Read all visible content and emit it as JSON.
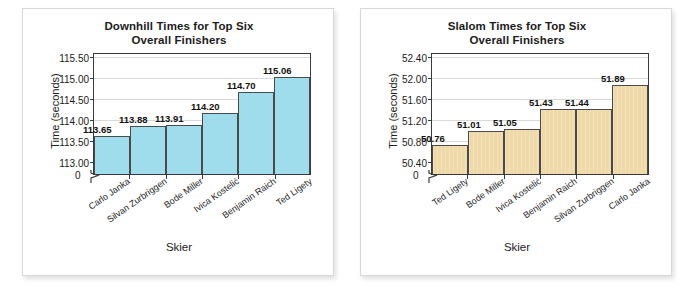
{
  "page": {
    "background": "#ffffff",
    "card_border": "#d8d8d8"
  },
  "charts": [
    {
      "id": "downhill",
      "title_line1": "Downhill Times for Top Six",
      "title_line2": "Overall Finishers",
      "xlabel": "Skier",
      "ylabel": "Time (seconds)",
      "zero_label": "0",
      "bar_color": "#9fdcec",
      "yticks": [
        "113.00",
        "113.50",
        "114.00",
        "114.50",
        "115.00",
        "115.50"
      ]
    },
    {
      "id": "slalom",
      "title_line1": "Slalom Times for Top Six",
      "title_line2": "Overall Finishers",
      "xlabel": "Skier",
      "ylabel": "Time (seconds)",
      "zero_label": "0",
      "bar_color": "#f0d9a8",
      "yticks": [
        "50.40",
        "50.80",
        "51.20",
        "51.60",
        "52.00",
        "52.40"
      ]
    }
  ],
  "chart_data": [
    {
      "type": "bar",
      "title": "Downhill Times for Top Six Overall Finishers",
      "xlabel": "Skier",
      "ylabel": "Time (seconds)",
      "ylim": [
        112.75,
        115.6
      ],
      "yticks": [
        113.0,
        113.5,
        114.0,
        114.5,
        115.0,
        115.5
      ],
      "ytick_labels": [
        "113.00",
        "113.50",
        "114.00",
        "114.50",
        "115.00",
        "115.50"
      ],
      "y_axis_break": true,
      "grid": true,
      "legend": "none",
      "bar_color": "#9fdcec",
      "categories": [
        "Carlo Janka",
        "Silvan Zurbriggen",
        "Bode Miller",
        "Ivica Kostelić",
        "Benjamin Raich",
        "Ted Ligety"
      ],
      "values": [
        113.65,
        113.88,
        113.91,
        114.2,
        114.7,
        115.06
      ],
      "data_labels": [
        "113.65",
        "113.88",
        "113.91",
        "114.20",
        "114.70",
        "115.06"
      ]
    },
    {
      "type": "bar",
      "title": "Slalom Times for Top Six Overall Finishers",
      "xlabel": "Skier",
      "ylabel": "Time (seconds)",
      "ylim": [
        50.2,
        52.48
      ],
      "yticks": [
        50.4,
        50.8,
        51.2,
        51.6,
        52.0,
        52.4
      ],
      "ytick_labels": [
        "50.40",
        "50.80",
        "51.20",
        "51.60",
        "52.00",
        "52.40"
      ],
      "y_axis_break": true,
      "grid": true,
      "legend": "none",
      "bar_color": "#f0d9a8",
      "categories": [
        "Ted Ligety",
        "Bode Miller",
        "Ivica Kostelić",
        "Benjamin Raich",
        "Silvan Zurbriggen",
        "Carlo Janka"
      ],
      "values": [
        50.76,
        51.01,
        51.05,
        51.43,
        51.44,
        51.89
      ],
      "data_labels": [
        "50.76",
        "51.01",
        "51.05",
        "51.43",
        "51.44",
        "51.89"
      ]
    }
  ]
}
